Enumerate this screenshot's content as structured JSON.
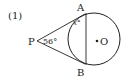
{
  "diagram": {
    "problem_number": "(1)",
    "points": {
      "P": "P",
      "A": "A",
      "B": "B",
      "O": "O"
    },
    "angle_P": "56°",
    "angle_x": "x°"
  }
}
